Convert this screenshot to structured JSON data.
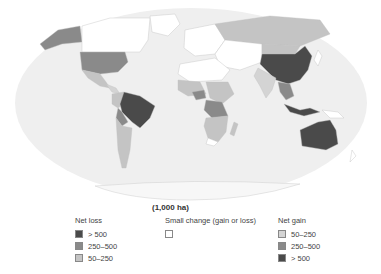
{
  "map": {
    "projection": "world-elliptical",
    "ocean_color": "#efefef",
    "border_color": "#bfbfbf",
    "regions": [
      {
        "name": "Canada",
        "category": "small_change"
      },
      {
        "name": "Greenland",
        "category": "small_change"
      },
      {
        "name": "Alaska",
        "category": "loss_250_500"
      },
      {
        "name": "United States",
        "category": "loss_250_500"
      },
      {
        "name": "Mexico",
        "category": "loss_50_250"
      },
      {
        "name": "Brazil",
        "category": "loss_gt_500"
      },
      {
        "name": "Bolivia",
        "category": "loss_250_500"
      },
      {
        "name": "Argentina",
        "category": "loss_50_250"
      },
      {
        "name": "Russia",
        "category": "loss_50_250"
      },
      {
        "name": "China",
        "category": "gain_gt_500"
      },
      {
        "name": "Central Africa",
        "category": "loss_250_500"
      },
      {
        "name": "Southern Africa",
        "category": "loss_50_250"
      },
      {
        "name": "Indonesia",
        "category": "loss_gt_500"
      },
      {
        "name": "Australia",
        "category": "loss_gt_500"
      },
      {
        "name": "India",
        "category": "small_change"
      }
    ]
  },
  "legend": {
    "unit": "(1,000 ha)",
    "net_loss": {
      "title": "Net loss",
      "items": [
        {
          "label": "> 500",
          "color": "#4a4a4a"
        },
        {
          "label": "250–500",
          "color": "#8a8a8a"
        },
        {
          "label": "50–250",
          "color": "#c4c4c4"
        }
      ]
    },
    "small_change": {
      "title": "Small change (gain or loss)",
      "items": [
        {
          "label": "",
          "color": "#ffffff"
        }
      ]
    },
    "net_gain": {
      "title": "Net gain",
      "items": [
        {
          "label": "50–250",
          "color": "#d4d4d4"
        },
        {
          "label": "250–500",
          "color": "#8a8a8a"
        },
        {
          "label": "> 500",
          "color": "#4a4a4a"
        }
      ]
    }
  }
}
